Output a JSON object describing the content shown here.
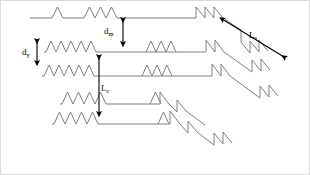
{
  "figure": {
    "type": "schematic-diagram",
    "width": 310,
    "height": 175,
    "background_color": "#ffffff",
    "line_color": "#808080",
    "arrow_color": "#000000",
    "border_color": "#d9d9d9"
  },
  "labels": [
    {
      "id": "d_m",
      "base": "d",
      "sub": "m",
      "x": 104,
      "y": 27,
      "meaning": "mean step separation"
    },
    {
      "id": "d_y",
      "base": "d",
      "sub": "y",
      "x": 22,
      "y": 48,
      "meaning": "vertical step spacing"
    },
    {
      "id": "L_c",
      "base": "L",
      "sub": "c",
      "x": 101,
      "y": 84,
      "meaning": "correlation length"
    },
    {
      "id": "L_s",
      "base": "L",
      "sub": "s",
      "x": 249,
      "y": 31,
      "meaning": "step length"
    }
  ],
  "arrows": [
    {
      "id": "arrow-dm",
      "kind": "double-vertical",
      "x1": 123,
      "y1": 19,
      "x2": 123,
      "y2": 45
    },
    {
      "id": "arrow-dy",
      "kind": "double-vertical",
      "x1": 37,
      "y1": 40,
      "x2": 37,
      "y2": 64
    },
    {
      "id": "arrow-Lc",
      "kind": "double-vertical",
      "x1": 99,
      "y1": 56,
      "x2": 99,
      "y2": 115
    },
    {
      "id": "arrow-Ls",
      "kind": "double-diagonal",
      "x1": 285,
      "y1": 58,
      "x2": 221,
      "y2": 18
    }
  ],
  "terraces": [
    {
      "id": "terrace-1",
      "baseline_y": 18,
      "x_start": 30,
      "x_end": 196,
      "zigzags": [
        {
          "x": 52,
          "teeth": 1,
          "w": 11,
          "h": 11
        },
        {
          "x": 84,
          "teeth": 3,
          "w": 11,
          "h": 11
        }
      ],
      "steps": [
        {
          "x": 196,
          "drop": 11,
          "run": 9
        },
        {
          "x": 205,
          "drop": 11,
          "run": 9
        },
        {
          "x": 214,
          "drop": 11,
          "run": 9
        }
      ]
    },
    {
      "id": "terrace-2",
      "baseline_y": 52,
      "x_start": 44,
      "x_end": 206,
      "zigzags": [
        {
          "x": 46,
          "teeth": 5,
          "w": 10,
          "h": 11
        },
        {
          "x": 146,
          "teeth": 3,
          "w": 10,
          "h": 11
        }
      ],
      "steps": [
        {
          "x": 206,
          "drop": 12,
          "run": 9
        },
        {
          "x": 215,
          "drop": 12,
          "run": 9
        }
      ]
    },
    {
      "id": "terrace-3",
      "baseline_y": 76,
      "x_start": 42,
      "x_end": 212,
      "zigzags": [
        {
          "x": 44,
          "teeth": 5,
          "w": 10,
          "h": 11
        },
        {
          "x": 142,
          "teeth": 3,
          "w": 10,
          "h": 11
        }
      ],
      "steps": [
        {
          "x": 212,
          "drop": 12,
          "run": 9
        },
        {
          "x": 221,
          "drop": 12,
          "run": 9
        }
      ]
    },
    {
      "id": "terrace-4",
      "baseline_y": 104,
      "x_start": 60,
      "x_end": 160,
      "zigzags": [
        {
          "x": 62,
          "teeth": 4,
          "w": 11,
          "h": 12
        },
        {
          "x": 150,
          "teeth": 2,
          "w": 11,
          "h": 12
        }
      ],
      "steps": [
        {
          "x": 160,
          "drop": 12,
          "run": 9
        }
      ]
    },
    {
      "id": "terrace-5",
      "baseline_y": 124,
      "x_start": 52,
      "x_end": 170,
      "zigzags": [
        {
          "x": 54,
          "teeth": 4,
          "w": 11,
          "h": 12
        },
        {
          "x": 158,
          "teeth": 2,
          "w": 11,
          "h": 12
        }
      ],
      "steps": [
        {
          "x": 170,
          "drop": 13,
          "run": 10
        }
      ]
    }
  ]
}
